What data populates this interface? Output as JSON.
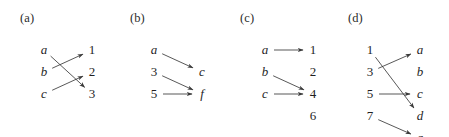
{
  "figure": {
    "width": 449,
    "height": 137,
    "background": "#ffffff",
    "ink_color": "#1f1f1f",
    "edge_color": "#3a3a3a"
  },
  "panels": [
    {
      "id": "panel-a",
      "label": "(a)",
      "label_x": 20,
      "label_y": 22,
      "origin_x": 0,
      "left_x": 44,
      "right_x": 92,
      "left_nodes": [
        {
          "text": "a",
          "kind": "letter",
          "y": 50
        },
        {
          "text": "b",
          "kind": "letter",
          "y": 72
        },
        {
          "text": "c",
          "kind": "letter",
          "y": 94
        }
      ],
      "right_nodes": [
        {
          "text": "1",
          "kind": "numeral",
          "y": 50
        },
        {
          "text": "2",
          "kind": "numeral",
          "y": 72
        },
        {
          "text": "3",
          "kind": "numeral",
          "y": 94
        }
      ],
      "edges": [
        {
          "from": "a",
          "to": "3",
          "from_index": 0,
          "to_index": 2
        },
        {
          "from": "b",
          "to": "1",
          "from_index": 1,
          "to_index": 0
        },
        {
          "from": "c",
          "to": "2",
          "from_index": 2,
          "to_index": 1
        }
      ]
    },
    {
      "id": "panel-b",
      "label": "(b)",
      "label_x": 130,
      "label_y": 22,
      "origin_x": 110,
      "left_x": 44,
      "right_x": 92,
      "left_nodes": [
        {
          "text": "a",
          "kind": "letter",
          "y": 50
        },
        {
          "text": "3",
          "kind": "numeral",
          "y": 72
        },
        {
          "text": "5",
          "kind": "numeral",
          "y": 94
        }
      ],
      "right_nodes": [
        {
          "text": "c",
          "kind": "letter",
          "y": 72
        },
        {
          "text": "f",
          "kind": "letter",
          "y": 94
        }
      ],
      "edges": [
        {
          "from": "a",
          "to": "c",
          "from_index": 0,
          "to_index": 0
        },
        {
          "from": "3",
          "to": "f",
          "from_index": 1,
          "to_index": 1
        },
        {
          "from": "5",
          "to": "f",
          "from_index": 2,
          "to_index": 1
        }
      ]
    },
    {
      "id": "panel-c",
      "label": "(c)",
      "label_x": 240,
      "label_y": 22,
      "origin_x": 221,
      "left_x": 44,
      "right_x": 92,
      "left_nodes": [
        {
          "text": "a",
          "kind": "letter",
          "y": 50
        },
        {
          "text": "b",
          "kind": "letter",
          "y": 72
        },
        {
          "text": "c",
          "kind": "letter",
          "y": 94
        }
      ],
      "right_nodes": [
        {
          "text": "1",
          "kind": "numeral",
          "y": 50
        },
        {
          "text": "2",
          "kind": "numeral",
          "y": 72
        },
        {
          "text": "4",
          "kind": "numeral",
          "y": 94
        },
        {
          "text": "6",
          "kind": "numeral",
          "y": 116
        }
      ],
      "edges": [
        {
          "from": "a",
          "to": "1",
          "from_index": 0,
          "to_index": 0
        },
        {
          "from": "b",
          "to": "4",
          "from_index": 1,
          "to_index": 2
        },
        {
          "from": "c",
          "to": "4",
          "from_index": 2,
          "to_index": 2
        }
      ]
    },
    {
      "id": "panel-d",
      "label": "(d)",
      "label_x": 348,
      "label_y": 22,
      "origin_x": 332,
      "left_x": 38,
      "right_x": 88,
      "left_nodes": [
        {
          "text": "1",
          "kind": "numeral",
          "y": 50
        },
        {
          "text": "3",
          "kind": "numeral",
          "y": 72
        },
        {
          "text": "5",
          "kind": "numeral",
          "y": 94
        },
        {
          "text": "7",
          "kind": "numeral",
          "y": 116
        }
      ],
      "right_nodes": [
        {
          "text": "a",
          "kind": "letter",
          "y": 50
        },
        {
          "text": "b",
          "kind": "letter",
          "y": 72
        },
        {
          "text": "c",
          "kind": "letter",
          "y": 94
        },
        {
          "text": "d",
          "kind": "letter",
          "y": 116
        },
        {
          "text": "g",
          "kind": "letter",
          "y": 138
        }
      ],
      "edges": [
        {
          "from": "1",
          "to": "d",
          "from_index": 0,
          "to_index": 3
        },
        {
          "from": "3",
          "to": "a",
          "from_index": 1,
          "to_index": 0
        },
        {
          "from": "5",
          "to": "c",
          "from_index": 2,
          "to_index": 2
        },
        {
          "from": "7",
          "to": "g",
          "from_index": 3,
          "to_index": 4
        }
      ]
    }
  ]
}
